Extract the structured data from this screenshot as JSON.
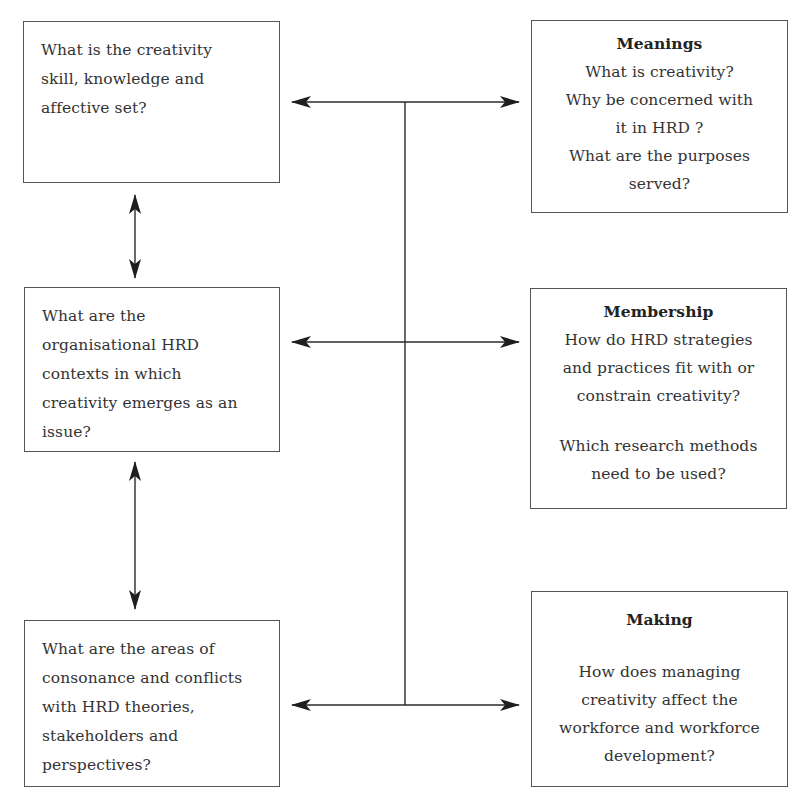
{
  "diagram": {
    "left_boxes": [
      {
        "id": "skill-knowledge-affective",
        "lines": [
          "What is the creativity",
          "skill, knowledge and",
          "affective set?"
        ]
      },
      {
        "id": "organisational-contexts",
        "lines": [
          "What are the",
          "organisational HRD",
          "contexts in which",
          "creativity emerges as an",
          "issue?"
        ]
      },
      {
        "id": "consonance-conflicts",
        "lines": [
          "What are the  areas of",
          "consonance and conflicts",
          "with HRD theories,",
          "stakeholders and",
          "perspectives?"
        ]
      }
    ],
    "right_boxes": [
      {
        "id": "meanings",
        "title": "Meanings",
        "lines": [
          "What is creativity?",
          "Why be concerned with",
          "it in HRD ?",
          "What are the purposes",
          "served?"
        ]
      },
      {
        "id": "membership",
        "title": "Membership",
        "lines": [
          "How do HRD strategies",
          "and practices fit with or",
          "constrain creativity?",
          "",
          "Which research methods",
          "need to be used?"
        ]
      },
      {
        "id": "making",
        "title": "Making",
        "lines": [
          "",
          "How does managing",
          "creativity  affect the",
          "workforce and workforce",
          "development?"
        ]
      }
    ],
    "connectors": {
      "vertical_left": [
        {
          "from": "skill-knowledge-affective",
          "to": "organisational-contexts",
          "type": "bidirectional"
        },
        {
          "from": "organisational-contexts",
          "to": "consonance-conflicts",
          "type": "bidirectional"
        }
      ],
      "horizontal": [
        {
          "from": "skill-knowledge-affective",
          "to": "meanings",
          "type": "bidirectional"
        },
        {
          "from": "organisational-contexts",
          "to": "membership",
          "type": "bidirectional"
        },
        {
          "from": "consonance-conflicts",
          "to": "making",
          "type": "bidirectional"
        }
      ],
      "central_spine": "joins all three horizontal arrows"
    },
    "colors": {
      "line": "#1e1e1e",
      "box_border": "#555555",
      "text": "#333333"
    }
  }
}
